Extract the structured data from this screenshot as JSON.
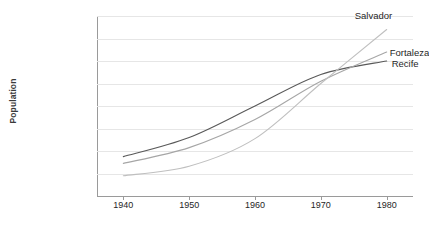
{
  "chart_data": {
    "type": "line",
    "title": "",
    "xlabel": "",
    "ylabel": "Population",
    "x": [
      1940,
      1950,
      1960,
      1970,
      1980
    ],
    "categories": [
      "1940",
      "1950",
      "1960",
      "1970",
      "1980"
    ],
    "xlim": [
      1936,
      1984
    ],
    "ylim": [
      0,
      1600000
    ],
    "ytick_labels": [
      "0",
      "200,000",
      "400,000",
      "600,000",
      "800,000",
      "1,000,000",
      "1,200,000",
      "1,400,000",
      "1,600,000"
    ],
    "ytick_values": [
      0,
      200000,
      400000,
      600000,
      800000,
      1000000,
      1200000,
      1400000,
      1600000
    ],
    "grid": true,
    "legend_position": "inline-right-end-of-line",
    "series": [
      {
        "name": "Recife",
        "color": "#595959",
        "values": [
          350000,
          520000,
          800000,
          1080000,
          1200000
        ]
      },
      {
        "name": "Fortaleza",
        "color": "#a6a6a6",
        "values": [
          290000,
          430000,
          680000,
          1020000,
          1280000
        ]
      },
      {
        "name": "Salvador",
        "color": "#bfbfbf",
        "values": [
          180000,
          265000,
          510000,
          1000000,
          1480000
        ]
      }
    ]
  },
  "labels": {
    "salvador": "Salvador",
    "fortaleza": "Fortaleza",
    "recife": "Recife"
  },
  "colors": {
    "axis": "#9a9a9a",
    "grid": "#e6e6e6",
    "text": "#262626",
    "background": "#ffffff"
  }
}
